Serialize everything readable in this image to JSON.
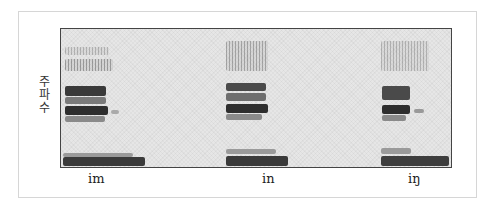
{
  "figure": {
    "type": "spectrogram",
    "y_axis_label": [
      "주",
      "파",
      "수"
    ],
    "y_axis_label_full": "주파수",
    "segments": [
      {
        "label": "im",
        "label_x": 96
      },
      {
        "label": "in",
        "label_x": 268
      },
      {
        "label": "iŋ",
        "label_x": 414
      }
    ]
  },
  "colors": {
    "frame_border": "#d6d6d6",
    "plot_border": "#444444",
    "plot_background": "#e6e6e6",
    "dark_band": "#2e2e2e",
    "mid_band": "#6a6a6a"
  }
}
